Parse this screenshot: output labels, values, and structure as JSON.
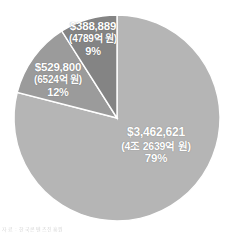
{
  "figure": {
    "name": "pie-chart-figure",
    "caption": "자료 : 한국콘텐츠진흥원"
  },
  "chart_data": {
    "type": "pie",
    "title": "",
    "subtitle": "",
    "xlabel": "",
    "ylabel": "",
    "legend_position": "none",
    "grid": false,
    "labels_inside_slices": true,
    "start_angle_deg": 0,
    "direction": "clockwise",
    "categories": [
      "$3,462,621",
      "$529,800",
      "$388,889"
    ],
    "values": [
      79,
      12,
      9
    ],
    "units": "percent",
    "colors": [
      "#b5b5b5",
      "#9b9b9b",
      "#848484"
    ],
    "slice_border_color": "#ffffff",
    "slices": [
      {
        "amount_usd": "$3,462,621",
        "amount_krw": "(4조 2639억 원)",
        "percent": "79%",
        "value": 79,
        "color": "#b5b5b5"
      },
      {
        "amount_usd": "$529,800",
        "amount_krw": "(6524억 원)",
        "percent": "12%",
        "value": 12,
        "color": "#9b9b9b"
      },
      {
        "amount_usd": "$388,889",
        "amount_krw": "(4789억 원)",
        "percent": "9%",
        "value": 9,
        "color": "#848484"
      }
    ]
  }
}
